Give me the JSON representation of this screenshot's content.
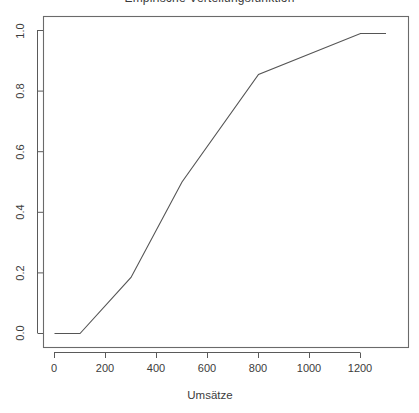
{
  "chart_data": {
    "type": "line",
    "title": "Empirische Verteilungsfunktion",
    "xlabel": "Umsätze",
    "ylabel": "",
    "xlim": [
      -52,
      1349
    ],
    "ylim": [
      -0.045,
      1.045
    ],
    "grid": false,
    "legend": null,
    "x": [
      0,
      100,
      300,
      500,
      800,
      1200,
      1300
    ],
    "values": [
      0.0,
      0.0,
      0.185,
      0.5,
      0.855,
      0.99,
      0.99
    ],
    "series": [
      {
        "name": "ECDF",
        "x": [
          0,
          100,
          300,
          500,
          800,
          1200,
          1300
        ],
        "values": [
          0.0,
          0.0,
          0.185,
          0.5,
          0.855,
          0.99,
          0.99
        ]
      }
    ],
    "xticks": [
      0,
      200,
      400,
      600,
      800,
      1000,
      1200
    ],
    "xtick_labels": [
      "0",
      "200",
      "400",
      "600",
      "800",
      "1000",
      "1200"
    ],
    "yticks": [
      0.0,
      0.2,
      0.4,
      0.6,
      0.8,
      1.0
    ],
    "ytick_labels": [
      "0.0",
      "0.2",
      "0.4",
      "0.6",
      "0.8",
      "1.0"
    ],
    "line_color": "#555555",
    "frame_color": "#6a6a6a",
    "background": "#ffffff"
  }
}
